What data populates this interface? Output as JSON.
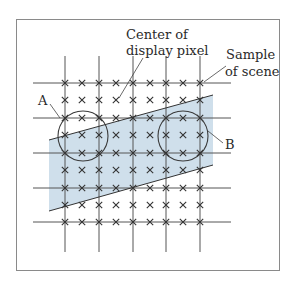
{
  "figure": {
    "labels": {
      "center_line1": "Center of",
      "center_line2": "display pixel",
      "sample_line1": "Sample",
      "sample_line2": "of scene",
      "a": "A",
      "b": "B"
    },
    "colors": {
      "frame": "#8a8a8a",
      "grid_line": "#555555",
      "sample_mark": "#333333",
      "shaded_region": "#cfdfeb",
      "circle": "#3a3a3a",
      "leader": "#444444"
    },
    "grid": {
      "columns_x": [
        65,
        82,
        99,
        116,
        133,
        150,
        166,
        183,
        200
      ],
      "rows_y": [
        83,
        100,
        118,
        135,
        153,
        170,
        188,
        205,
        222
      ],
      "vertical_lines_x": [
        65,
        99,
        133,
        166,
        200
      ],
      "horizontal_lines_y": [
        83,
        118,
        153,
        188,
        222
      ]
    },
    "shaded_region_polygon": [
      [
        49,
        140
      ],
      [
        213,
        95
      ],
      [
        213,
        165
      ],
      [
        49,
        211
      ]
    ],
    "circles": [
      {
        "id": "A",
        "cx": 83,
        "cy": 136,
        "r": 25
      },
      {
        "id": "B",
        "cx": 183,
        "cy": 136,
        "r": 25
      }
    ]
  }
}
